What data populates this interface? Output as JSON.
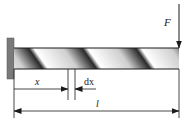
{
  "diagram": {
    "type": "cantilever-beam-torsion",
    "labels": {
      "force": "F",
      "position": "x",
      "differential": "dx",
      "length": "l"
    },
    "colors": {
      "wall": "#7a7a7a",
      "beam_dark": "#1a1a1a",
      "beam_light": "#ffffff",
      "line": "#1a1a1a"
    }
  }
}
